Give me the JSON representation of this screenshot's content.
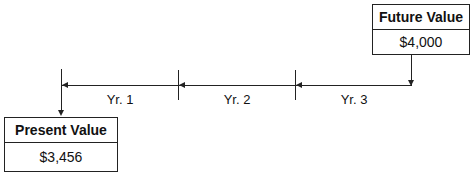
{
  "future": {
    "title": "Future Value",
    "value": "$4,000"
  },
  "present": {
    "title": "Present Value",
    "value": "$3,456"
  },
  "periods": [
    {
      "label": "Yr. 1"
    },
    {
      "label": "Yr. 2"
    },
    {
      "label": "Yr. 3"
    }
  ],
  "colors": {
    "line": "#222222",
    "background": "#ffffff"
  }
}
